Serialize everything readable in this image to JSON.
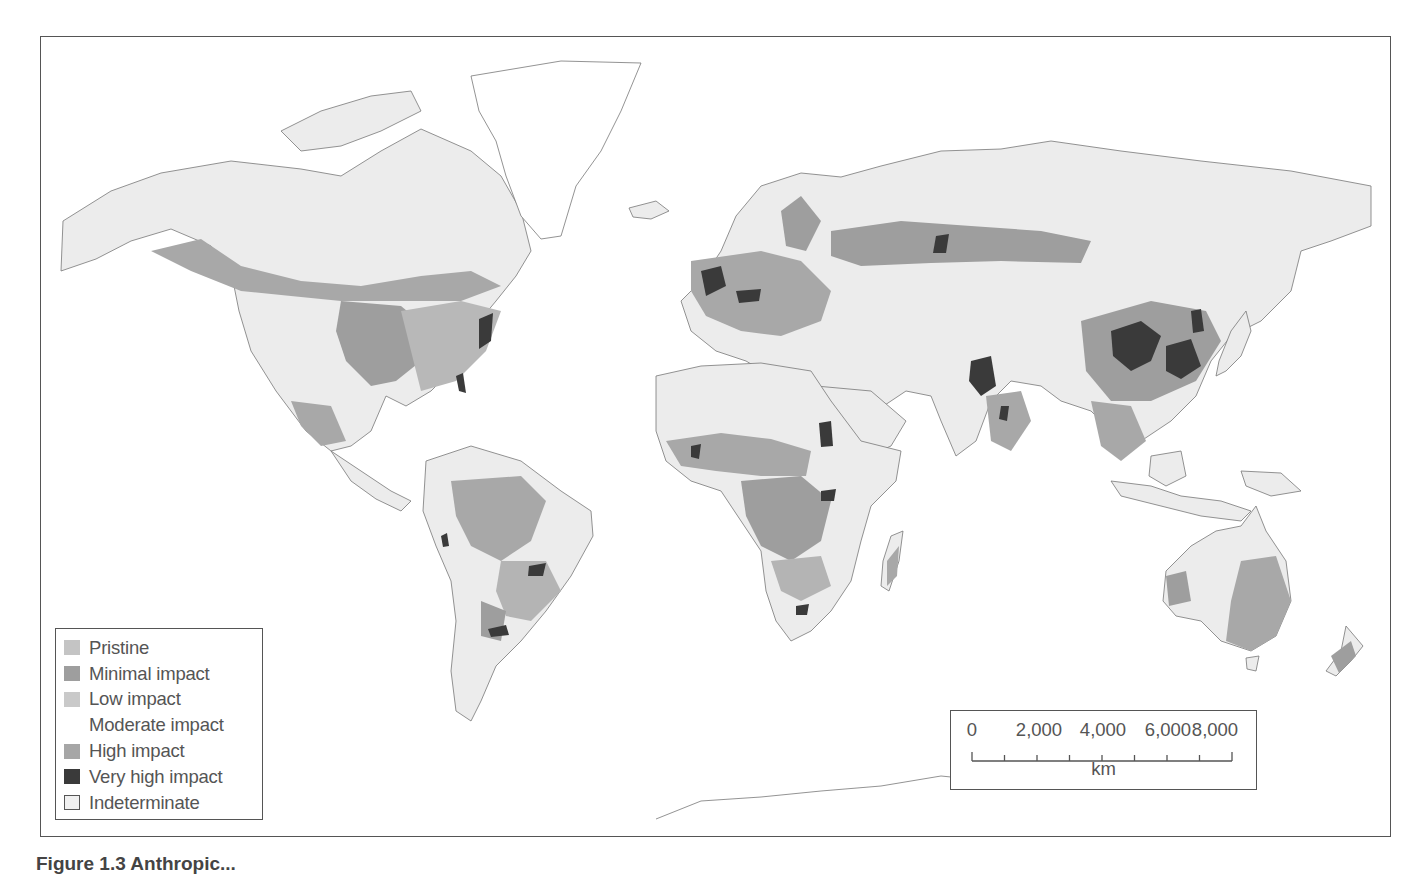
{
  "figure": {
    "caption_visible_fragment": "Figure 1.3 Anthropic..."
  },
  "map": {
    "type": "world choropleth",
    "subject": "Human impact on terrestrial ecosystems",
    "ocean_color": "#ffffff",
    "coastline_color": "#777777"
  },
  "legend": {
    "items": [
      {
        "label": "Pristine",
        "color": "#c4c4c4",
        "outlined": false
      },
      {
        "label": "Minimal impact",
        "color": "#9e9e9e",
        "outlined": false
      },
      {
        "label": "Low impact",
        "color": "#c9c9c9",
        "outlined": false
      },
      {
        "label": "Moderate impact",
        "color": "#ffffff",
        "outlined": false
      },
      {
        "label": "High impact",
        "color": "#a6a6a6",
        "outlined": false
      },
      {
        "label": "Very high impact",
        "color": "#3a3a3a",
        "outlined": false
      },
      {
        "label": "Indeterminate",
        "color": "#f0f0f0",
        "outlined": true
      }
    ]
  },
  "scale_bar": {
    "labels": [
      "0",
      "2,000",
      "4,000",
      "6,000",
      "8,000"
    ],
    "unit": "km",
    "max_value": 8000
  },
  "colors": {
    "land_base": "#ececec",
    "minimal": "#9e9e9e",
    "high": "#a6a6a6",
    "low": "#c9c9c9",
    "very_high": "#3a3a3a",
    "frame": "#555555"
  }
}
